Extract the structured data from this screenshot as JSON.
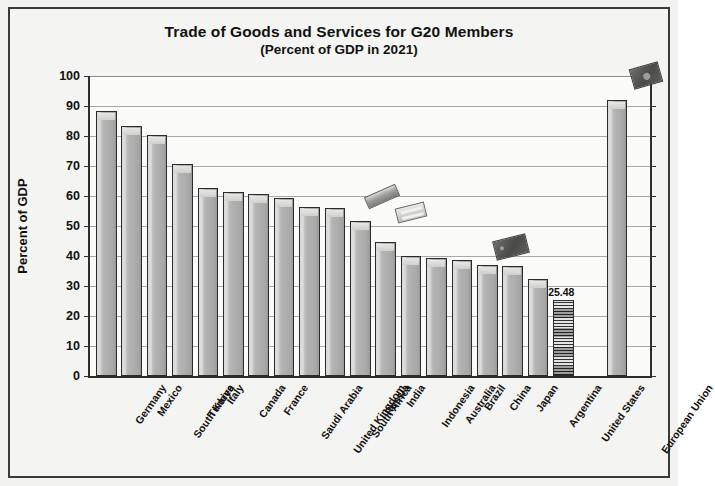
{
  "chart_data": {
    "type": "bar",
    "title": "Trade of Goods and Services for G20 Members",
    "subtitle": "(Percent of GDP in 2021)",
    "xlabel": "",
    "ylabel": "Percent of GDP",
    "ylim": [
      0,
      100
    ],
    "ytick_step": 10,
    "yticks": [
      "0",
      "10",
      "20",
      "30",
      "40",
      "50",
      "60",
      "70",
      "80",
      "90",
      "100"
    ],
    "grid": true,
    "legend": "none",
    "categories": [
      "Germany",
      "Mexico",
      "South Korea",
      "Türkiye",
      "Italy",
      "Canada",
      "France",
      "Saudi Arabia",
      "United Kingdom",
      "South Africa",
      "Russia",
      "India",
      "Indonesia",
      "Australia",
      "Brazil",
      "China",
      "Japan",
      "Argentina",
      "United States",
      "European Union"
    ],
    "values": [
      88.5,
      83.5,
      80.5,
      70.8,
      62.8,
      61.3,
      60.8,
      59.3,
      56.5,
      56.0,
      51.8,
      44.8,
      40.0,
      39.5,
      38.8,
      37.0,
      36.6,
      32.2,
      25.48,
      92.0
    ],
    "highlighted_category": "United States",
    "highlighted_value_label": "25.48",
    "separated_category": "European Union",
    "annotations": [
      {
        "name": "scan-artifact-1",
        "kind": "light-streak"
      },
      {
        "name": "scan-artifact-2",
        "kind": "light-clip"
      },
      {
        "name": "scan-artifact-3",
        "kind": "dark-card"
      },
      {
        "name": "scan-artifact-4",
        "kind": "dark-card"
      }
    ],
    "colors": {
      "bar_fill": "#b2b2b2",
      "bar_border": "#2b2b2b",
      "highlight_fill": "#9a9a9a",
      "grid": "#a8a8a8",
      "axis": "#2e2e2e",
      "text": "#111111",
      "background": "#f4f4f2"
    }
  }
}
